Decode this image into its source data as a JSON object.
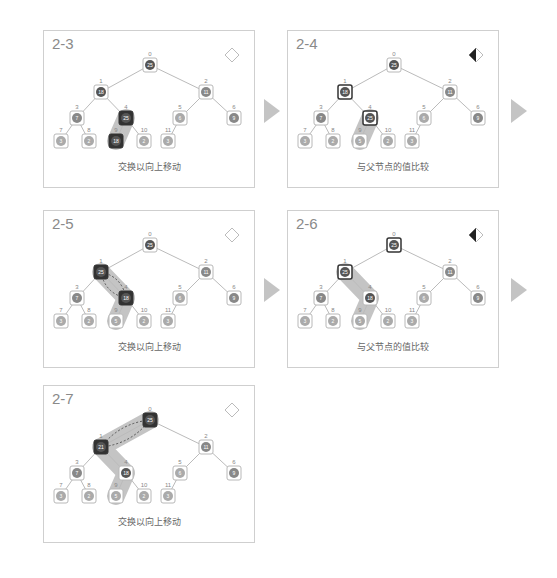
{
  "colors": {
    "panel_border": "#cfcfcf",
    "edge": "#bbbbbb",
    "node_border": "#b8b8b8",
    "node_fill": "#9a9a9a",
    "active_fill": "#333333",
    "highlight": "#b0b0b0",
    "arrow": "#c4c4c4",
    "title": "#8a8a8a",
    "caption": "#666666"
  },
  "tree_layout": {
    "indices": [
      "0",
      "1",
      "2",
      "3",
      "4",
      "5",
      "6",
      "7",
      "8",
      "9",
      "10",
      "11"
    ]
  },
  "panels": [
    {
      "id": "2-3",
      "title": "2-3",
      "caption": "交换以向上移动",
      "status_icon": "diamond-outline-icon",
      "values": [
        "25",
        "18",
        "11",
        "7",
        "25",
        "6",
        "9",
        "3",
        "2",
        "18",
        "2",
        "3"
      ],
      "node_styles": [
        "dark",
        "dark",
        "mid",
        "mid",
        "black",
        "light",
        "mid",
        "light",
        "light",
        "black",
        "light",
        "light"
      ],
      "highlight_path": [
        4,
        9
      ],
      "swap_arrows": false,
      "has_next_arrow": true
    },
    {
      "id": "2-4",
      "title": "2-4",
      "caption": "与父节点的值比较",
      "status_icon": "diamond-half-filled-icon",
      "values": [
        "25",
        "18",
        "11",
        "7",
        "25",
        "6",
        "9",
        "3",
        "2",
        "5",
        "2",
        "3"
      ],
      "node_styles": [
        "dark",
        "framed",
        "mid",
        "mid",
        "framed",
        "light",
        "mid",
        "light",
        "light",
        "light",
        "light",
        "light"
      ],
      "highlight_path": [
        4,
        9
      ],
      "swap_arrows": false,
      "has_next_arrow": true
    },
    {
      "id": "2-5",
      "title": "2-5",
      "caption": "交换以向上移动",
      "status_icon": "diamond-outline-icon",
      "values": [
        "25",
        "25",
        "11",
        "7",
        "18",
        "6",
        "9",
        "3",
        "2",
        "5",
        "2",
        "3"
      ],
      "node_styles": [
        "dark",
        "black",
        "mid",
        "mid",
        "black",
        "light",
        "mid",
        "light",
        "light",
        "light",
        "light",
        "light"
      ],
      "highlight_path": [
        1,
        4,
        9
      ],
      "swap_arrows": true,
      "swap_pair": [
        1,
        4
      ],
      "has_next_arrow": true
    },
    {
      "id": "2-6",
      "title": "2-6",
      "caption": "与父节点的值比较",
      "status_icon": "diamond-half-filled-icon",
      "values": [
        "25",
        "25",
        "11",
        "7",
        "18",
        "6",
        "9",
        "3",
        "2",
        "5",
        "2",
        "3"
      ],
      "node_styles": [
        "framed",
        "framed",
        "mid",
        "mid",
        "dark",
        "light",
        "mid",
        "light",
        "light",
        "light",
        "light",
        "light"
      ],
      "highlight_path": [
        1,
        4,
        9
      ],
      "swap_arrows": false,
      "has_next_arrow": true
    },
    {
      "id": "2-7",
      "title": "2-7",
      "caption": "交换以向上移动",
      "status_icon": "diamond-outline-icon",
      "values": [
        "25",
        "21",
        "11",
        "7",
        "18",
        "6",
        "9",
        "3",
        "2",
        "5",
        "2",
        "3"
      ],
      "node_styles": [
        "black",
        "black",
        "mid",
        "mid",
        "dark",
        "light",
        "mid",
        "light",
        "light",
        "light",
        "light",
        "light"
      ],
      "highlight_path": [
        0,
        1,
        4,
        9
      ],
      "swap_arrows": true,
      "swap_pair": [
        0,
        1
      ],
      "has_next_arrow": false
    }
  ]
}
